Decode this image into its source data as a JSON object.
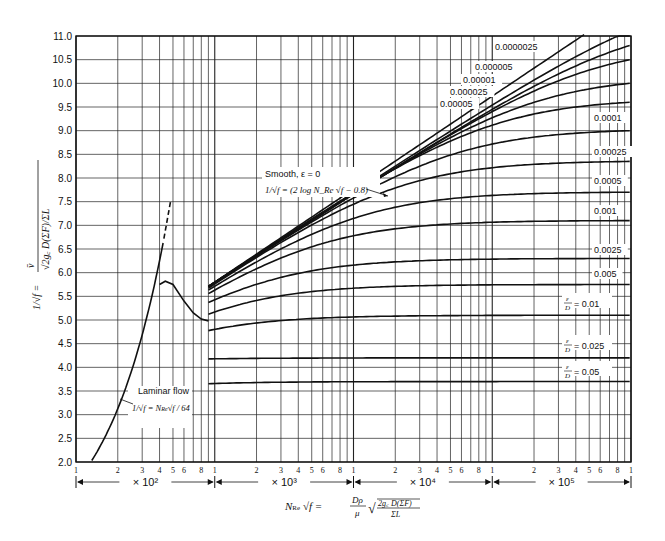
{
  "chart_data": {
    "type": "line",
    "title": "",
    "xlabel": "N_Re √f = (Dρ/μ) √(2 g_c D(ΣF) / ΣL)",
    "ylabel": "1/√f = v̄ / √(2 g_c D(ΣF)/ΣL)",
    "xscale": "log",
    "xlim": [
      100,
      1000000
    ],
    "ylim": [
      2.0,
      11.0
    ],
    "grid": true,
    "yticks": [
      "2.0",
      "2.5",
      "3.0",
      "3.5",
      "4.0",
      "4.5",
      "5.0",
      "5.5",
      "6.0",
      "6.5",
      "7.0",
      "7.5",
      "8.0",
      "8.5",
      "9.0",
      "9.5",
      "10.0",
      "10.5",
      "11.0"
    ],
    "xtick_labels": [
      "1",
      "2",
      "3",
      "4",
      "5",
      "6",
      "8",
      "1",
      "2",
      "3",
      "4",
      "5",
      "6",
      "8",
      "1",
      "2",
      "3",
      "4",
      "5",
      "6",
      "8",
      "1",
      "2",
      "3",
      "4",
      "5",
      "6",
      "8",
      "1"
    ],
    "decade_labels": [
      "× 10²",
      "× 10³",
      "× 10⁴",
      "× 10⁵"
    ],
    "annotations": {
      "smooth_title": "Smooth, ε = 0",
      "smooth_eq": "1/√f = (2 log N_Re √f − 0.8)",
      "laminar_title": "Laminar flow",
      "laminar_eq": "1/√f = N_Re √f / 64"
    },
    "series": [
      {
        "name": "Laminar flow",
        "x": [
          130,
          200,
          300,
          400,
          440
        ],
        "y": [
          2.0,
          3.1,
          4.7,
          5.75,
          5.82
        ]
      },
      {
        "name": "Smooth, ε = 0",
        "x": [
          1000,
          2000,
          5000,
          10000,
          20000,
          50000,
          100000,
          200000,
          500000,
          1000000
        ],
        "y": [
          5.0,
          5.7,
          6.4,
          7.1,
          7.7,
          8.6,
          9.2,
          9.8,
          10.6,
          11.2
        ]
      },
      {
        "name": "0.0000025",
        "x": [
          1000,
          10000,
          100000,
          1000000
        ],
        "y": [
          5.0,
          7.1,
          9.2,
          11.0
        ]
      },
      {
        "name": "0.000005",
        "x": [
          1000,
          10000,
          100000,
          1000000
        ],
        "y": [
          5.0,
          7.1,
          9.2,
          10.8
        ]
      },
      {
        "name": "0.00001",
        "x": [
          1000,
          10000,
          100000,
          1000000
        ],
        "y": [
          5.0,
          7.05,
          9.0,
          10.5
        ]
      },
      {
        "name": "0.000025",
        "x": [
          1000,
          10000,
          100000,
          1000000
        ],
        "y": [
          5.0,
          7.0,
          8.8,
          10.0
        ]
      },
      {
        "name": "0.00005",
        "x": [
          1000,
          10000,
          100000,
          1000000
        ],
        "y": [
          4.98,
          6.9,
          8.6,
          9.6
        ]
      },
      {
        "name": "0.0001",
        "x": [
          1000,
          10000,
          100000,
          1000000
        ],
        "y": [
          4.95,
          6.8,
          8.3,
          9.0
        ]
      },
      {
        "name": "0.00025",
        "x": [
          1000,
          10000,
          100000,
          1000000
        ],
        "y": [
          4.9,
          6.5,
          7.8,
          8.35
        ]
      },
      {
        "name": "0.0005",
        "x": [
          1000,
          10000,
          100000,
          1000000
        ],
        "y": [
          4.85,
          6.2,
          7.3,
          7.7
        ]
      },
      {
        "name": "0.001",
        "x": [
          1000,
          10000,
          100000,
          1000000
        ],
        "y": [
          4.75,
          5.9,
          6.8,
          7.1
        ]
      },
      {
        "name": "0.0025",
        "x": [
          1000,
          10000,
          100000,
          1000000
        ],
        "y": [
          4.5,
          5.5,
          6.1,
          6.3
        ]
      },
      {
        "name": "0.005",
        "x": [
          1000,
          10000,
          100000,
          1000000
        ],
        "y": [
          4.4,
          5.2,
          5.6,
          5.7
        ]
      },
      {
        "name": "ε/D = 0.01",
        "x": [
          1000,
          10000,
          100000,
          1000000
        ],
        "y": [
          4.4,
          4.9,
          5.05,
          5.1
        ]
      },
      {
        "name": "ε/D = 0.025",
        "x": [
          1000,
          10000,
          100000,
          1000000
        ],
        "y": [
          4.05,
          4.2,
          4.2,
          4.2
        ]
      },
      {
        "name": "ε/D = 0.05",
        "x": [
          1000,
          10000,
          100000,
          1000000
        ],
        "y": [
          3.65,
          3.7,
          3.7,
          3.7
        ]
      }
    ],
    "curve_labels": [
      "0.0000025",
      "0.000005",
      "0.00001",
      "0.000025",
      "0.00005",
      "0.0001",
      "0.00025",
      "0.0005",
      "0.001",
      "0.0025",
      "0.005",
      "= 0.01",
      "= 0.025",
      "= 0.05"
    ],
    "eps_over_D": "ε/D"
  }
}
